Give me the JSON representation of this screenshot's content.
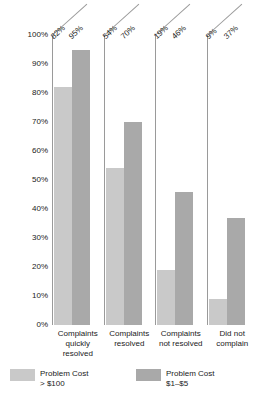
{
  "chart_data": {
    "type": "bar",
    "title": "",
    "xlabel": "",
    "ylabel": "Percentage of People Intending to Repurchase",
    "ylim": [
      0,
      100
    ],
    "grid": false,
    "legend_position": "bottom",
    "categories": [
      "Complaints quickly resolved",
      "Complaints resolved",
      "Complaints not resolved",
      "Did not complain"
    ],
    "series": [
      {
        "name": "Problem Cost > $100",
        "color": "#c9c9c9",
        "values": [
          82,
          54,
          19,
          9
        ]
      },
      {
        "name": "Problem Cost $1–$5",
        "color": "#a9a9a9",
        "values": [
          95,
          70,
          46,
          37
        ]
      }
    ],
    "y_ticks": [
      "0%",
      "10%",
      "20%",
      "30%",
      "40%",
      "50%",
      "60%",
      "70%",
      "80%",
      "90%",
      "100%"
    ],
    "data_labels": [
      [
        "82%",
        "95%"
      ],
      [
        "54%",
        "70%"
      ],
      [
        "19%",
        "46%"
      ],
      [
        "9%",
        "37%"
      ]
    ]
  },
  "axis": {
    "y_title": "Percentage of People Intending to Repurchase",
    "ticks": [
      {
        "label": "100%",
        "value": 100
      },
      {
        "label": "90%",
        "value": 90
      },
      {
        "label": "80%",
        "value": 80
      },
      {
        "label": "70%",
        "value": 70
      },
      {
        "label": "60%",
        "value": 60
      },
      {
        "label": "50%",
        "value": 50
      },
      {
        "label": "40%",
        "value": 40
      },
      {
        "label": "30%",
        "value": 30
      },
      {
        "label": "20%",
        "value": 20
      },
      {
        "label": "10%",
        "value": 10
      },
      {
        "label": "0%",
        "value": 0
      }
    ]
  },
  "categories": [
    {
      "line1": "Complaints",
      "line2": "quickly",
      "line3": "resolved"
    },
    {
      "line1": "Complaints",
      "line2": "resolved",
      "line3": ""
    },
    {
      "line1": "Complaints",
      "line2": "not resolved",
      "line3": ""
    },
    {
      "line1": "Did not",
      "line2": "complain",
      "line3": ""
    }
  ],
  "groups": [
    {
      "label_light": "82%",
      "label_dark": "95%",
      "light": 82,
      "dark": 95
    },
    {
      "label_light": "54%",
      "label_dark": "70%",
      "light": 54,
      "dark": 70
    },
    {
      "label_light": "19%",
      "label_dark": "46%",
      "light": 19,
      "dark": 46
    },
    {
      "label_light": "9%",
      "label_dark": "37%",
      "light": 9,
      "dark": 37
    }
  ],
  "legend": {
    "items": [
      {
        "label": "Problem Cost\n> $100",
        "color": "#c9c9c9"
      },
      {
        "label": "Problem Cost\n$1–$5",
        "color": "#a9a9a9"
      }
    ]
  }
}
